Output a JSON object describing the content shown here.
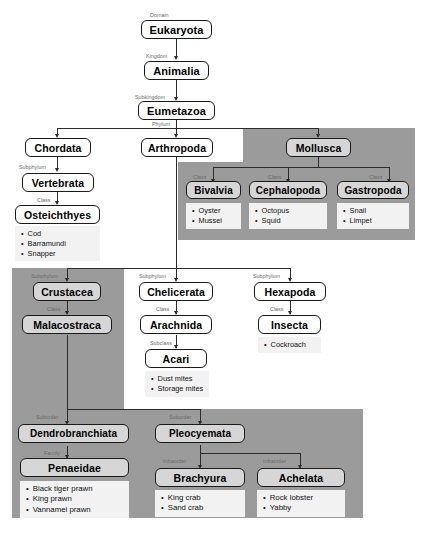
{
  "diagram": {
    "colors": {
      "panel_gray": "#9b9b9b",
      "box_fill": "#ffffff",
      "box_fill_shaded": "#d6d6d6",
      "examples_fill": "#f2f2f2",
      "line": "#2b2b2b",
      "rank_label": "#6b6b6b"
    },
    "ranks": {
      "domain": "Domain",
      "kingdom": "Kingdom",
      "subkingdom": "Subkingdom",
      "phylum": "Phylum",
      "subphylum": "Subphylum",
      "class": "Class",
      "subclass": "Subclass",
      "suborder": "Suborder",
      "infraorder": "Infraorder",
      "family": "Family"
    },
    "nodes": {
      "eukaryota": "Eukaryota",
      "animalia": "Animalia",
      "eumetazoa": "Eumetazoa",
      "chordata": "Chordata",
      "arthropoda": "Arthropoda",
      "mollusca": "Mollusca",
      "vertebrata": "Vertebrata",
      "osteichthyes": "Osteichthyes",
      "bivalvia": "Bivalvia",
      "cephalopoda": "Cephalopoda",
      "gastropoda": "Gastropoda",
      "crustacea": "Crustacea",
      "chelicerata": "Chelicerata",
      "hexapoda": "Hexapoda",
      "malacostraca": "Malacostraca",
      "arachnida": "Arachnida",
      "insecta": "Insecta",
      "acari": "Acari",
      "dendrobranchiata": "Dendrobranchiata",
      "pleocyemata": "Pleocyemata",
      "penaeidae": "Penaeidae",
      "brachyura": "Brachyura",
      "achelata": "Achelata"
    },
    "examples": {
      "osteichthyes": [
        "Cod",
        "Barramundi",
        "Snapper"
      ],
      "bivalvia": [
        "Oyster",
        "Mussel"
      ],
      "cephalopoda": [
        "Octopus",
        "Squid"
      ],
      "gastropoda": [
        "Snail",
        "Limpet"
      ],
      "acari": [
        "Dust mites",
        "Storage mites"
      ],
      "insecta": [
        "Cockroach"
      ],
      "penaeidae": [
        "Black tiger prawn",
        "King prawn",
        "Vannamei prawn"
      ],
      "brachyura": [
        "King crab",
        "Sand crab"
      ],
      "achelata": [
        "Rock lobster",
        "Yabby"
      ]
    }
  }
}
